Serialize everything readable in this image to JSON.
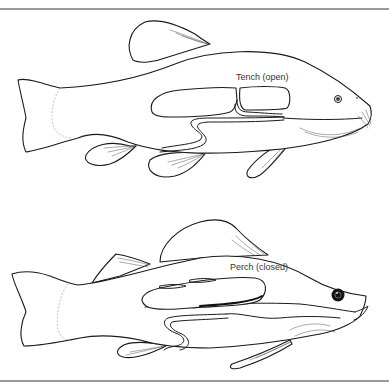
{
  "diagram": {
    "type": "swim-bladder-comparison",
    "figures": [
      {
        "id": "tench",
        "label": "Tench (open)"
      },
      {
        "id": "perch",
        "label": "Perch (closed)"
      }
    ],
    "colors": {
      "line": "#1a1a1a",
      "rule": "#9a9a9a",
      "background": "#ffffff"
    }
  }
}
